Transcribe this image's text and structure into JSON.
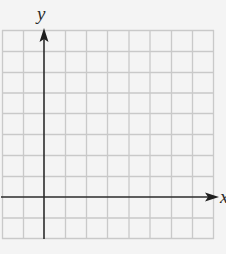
{
  "diagram": {
    "type": "coordinate-grid",
    "axes": {
      "x_label": "x",
      "y_label": "y"
    },
    "grid": {
      "columns": 10,
      "rows": 10,
      "origin_column": 2,
      "origin_row_from_bottom": 2,
      "line_color": "#c8c8c8",
      "axis_color": "#2b2b2b",
      "background": "#f4f4f4"
    }
  }
}
